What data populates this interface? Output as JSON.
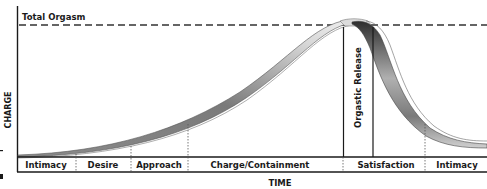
{
  "diagram": {
    "top_label": "Total Orgasm",
    "y_axis_label": "CHARGE",
    "x_axis_label": "TIME",
    "peak_label": "Orgastic Release",
    "phases": [
      {
        "label": "Intimacy",
        "x_start": 17,
        "x_end": 76
      },
      {
        "label": "Desire",
        "x_start": 76,
        "x_end": 131
      },
      {
        "label": "Approach",
        "x_start": 131,
        "x_end": 188
      },
      {
        "label": "Charge/Containment",
        "x_start": 188,
        "x_end": 343
      },
      {
        "label": "Satisfaction",
        "x_start": 343,
        "x_end": 425
      },
      {
        "label": "Intimacy",
        "x_start": 425,
        "x_end": 487
      }
    ],
    "colors": {
      "ink": "#1a1a1a",
      "band_light": "#e6e6e6",
      "band_dark": "#555555",
      "dash": "#333333"
    }
  }
}
